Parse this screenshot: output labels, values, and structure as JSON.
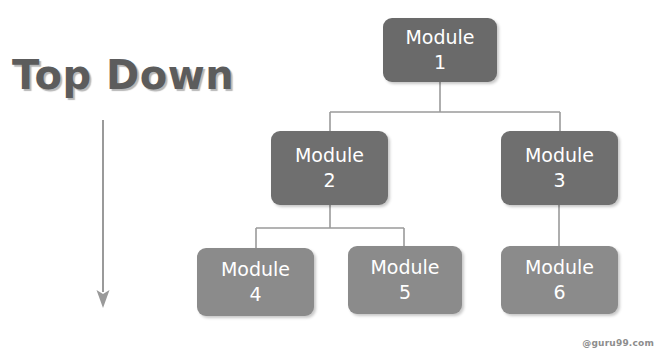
{
  "diagram": {
    "title": "Top Down",
    "arrow_icon": "down-arrow-icon",
    "watermark": "@guru99.com",
    "colors": {
      "tier1_box": "#6a6a6a",
      "tier2_box": "#6f6f6f",
      "tier3_box": "#8b8b8b",
      "box_text": "#ffffff",
      "title_text": "#5c5c5c",
      "connector_line": "#9a9a9a",
      "arrow": "#9a9a9a",
      "background": "#ffffff",
      "watermark_text": "#8d8d8d"
    },
    "nodes": [
      {
        "id": "module-1",
        "name": "Module",
        "number": "1",
        "tier": 1
      },
      {
        "id": "module-2",
        "name": "Module",
        "number": "2",
        "tier": 2
      },
      {
        "id": "module-3",
        "name": "Module",
        "number": "3",
        "tier": 2
      },
      {
        "id": "module-4",
        "name": "Module",
        "number": "4",
        "tier": 3
      },
      {
        "id": "module-5",
        "name": "Module",
        "number": "5",
        "tier": 3
      },
      {
        "id": "module-6",
        "name": "Module",
        "number": "6",
        "tier": 3
      }
    ],
    "edges": [
      {
        "from": "module-1",
        "to": "module-2"
      },
      {
        "from": "module-1",
        "to": "module-3"
      },
      {
        "from": "module-2",
        "to": "module-4"
      },
      {
        "from": "module-2",
        "to": "module-5"
      },
      {
        "from": "module-3",
        "to": "module-6"
      }
    ]
  }
}
